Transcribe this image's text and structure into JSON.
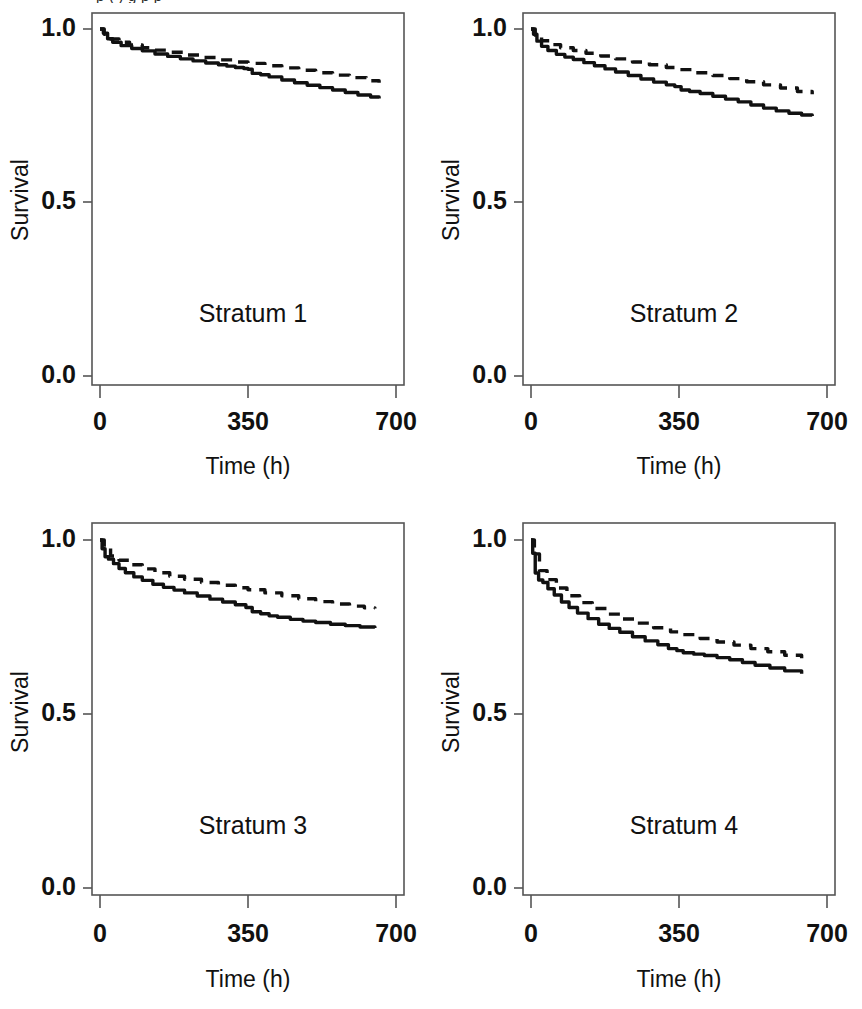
{
  "figure": {
    "clipped_top_text": "p             ( )  g      p                      p",
    "panel_count": 4,
    "grid": "2x2"
  },
  "axes": {
    "ylabel": "Survival",
    "xlabel": "Time (h)",
    "ytick_labels": [
      "1.0",
      "0.5",
      "0.0"
    ],
    "xtick_labels": [
      "0",
      "350",
      "700"
    ],
    "ylim": [
      0.0,
      1.0
    ],
    "xlim": [
      0,
      700
    ],
    "grid": false,
    "legend": "none"
  },
  "style": {
    "ink": "#111111",
    "frame": "#555555",
    "background": "#ffffff",
    "solid_series_name": "Observed",
    "dashed_series_name": "Predicted"
  },
  "chart_data": [
    {
      "type": "line",
      "title": "Stratum 1",
      "xlabel": "Time (h)",
      "ylabel": "Survival",
      "xlim": [
        0,
        700
      ],
      "ylim": [
        0.0,
        1.0
      ],
      "xticks": [
        0,
        350,
        700
      ],
      "yticks": [
        0.0,
        0.5,
        1.0
      ],
      "grid": false,
      "series": [
        {
          "name": "Observed",
          "style": "solid",
          "x": [
            0,
            8,
            18,
            30,
            50,
            75,
            100,
            130,
            160,
            190,
            220,
            250,
            280,
            300,
            320,
            340,
            350,
            360,
            380,
            400,
            430,
            460,
            490,
            520,
            550,
            580,
            610,
            640,
            660
          ],
          "y": [
            1.0,
            0.988,
            0.972,
            0.962,
            0.952,
            0.944,
            0.937,
            0.928,
            0.921,
            0.914,
            0.908,
            0.902,
            0.897,
            0.893,
            0.889,
            0.886,
            0.884,
            0.872,
            0.868,
            0.862,
            0.853,
            0.845,
            0.838,
            0.831,
            0.824,
            0.817,
            0.81,
            0.804,
            0.8
          ]
        },
        {
          "name": "Predicted",
          "style": "dashed",
          "x": [
            0,
            10,
            25,
            45,
            70,
            100,
            130,
            160,
            200,
            240,
            280,
            320,
            350,
            390,
            430,
            470,
            510,
            550,
            590,
            630,
            660
          ],
          "y": [
            1.0,
            0.985,
            0.971,
            0.962,
            0.954,
            0.946,
            0.939,
            0.933,
            0.925,
            0.918,
            0.911,
            0.905,
            0.901,
            0.894,
            0.888,
            0.881,
            0.874,
            0.867,
            0.86,
            0.851,
            0.845
          ]
        }
      ]
    },
    {
      "type": "line",
      "title": "Stratum 2",
      "xlabel": "Time (h)",
      "ylabel": "Survival",
      "xlim": [
        0,
        700
      ],
      "ylim": [
        0.0,
        1.0
      ],
      "xticks": [
        0,
        350,
        700
      ],
      "yticks": [
        0.0,
        0.5,
        1.0
      ],
      "grid": false,
      "series": [
        {
          "name": "Observed",
          "style": "solid",
          "x": [
            0,
            6,
            14,
            25,
            40,
            60,
            80,
            100,
            125,
            150,
            175,
            200,
            230,
            260,
            290,
            320,
            340,
            355,
            375,
            400,
            430,
            460,
            490,
            520,
            550,
            580,
            610,
            640,
            665
          ],
          "y": [
            1.0,
            0.985,
            0.965,
            0.95,
            0.938,
            0.927,
            0.919,
            0.912,
            0.903,
            0.894,
            0.885,
            0.876,
            0.866,
            0.856,
            0.847,
            0.839,
            0.834,
            0.824,
            0.82,
            0.814,
            0.806,
            0.798,
            0.79,
            0.781,
            0.772,
            0.764,
            0.757,
            0.752,
            0.749
          ]
        },
        {
          "name": "Predicted",
          "style": "dashed",
          "x": [
            0,
            10,
            25,
            45,
            70,
            100,
            130,
            165,
            200,
            240,
            280,
            320,
            350,
            390,
            430,
            470,
            510,
            550,
            590,
            630,
            665
          ],
          "y": [
            1.0,
            0.982,
            0.966,
            0.955,
            0.946,
            0.938,
            0.93,
            0.922,
            0.914,
            0.905,
            0.897,
            0.889,
            0.883,
            0.874,
            0.866,
            0.857,
            0.848,
            0.839,
            0.83,
            0.82,
            0.812
          ]
        }
      ]
    },
    {
      "type": "line",
      "title": "Stratum 3",
      "xlabel": "Time (h)",
      "ylabel": "Survival",
      "xlim": [
        0,
        700
      ],
      "ylim": [
        0.0,
        1.0
      ],
      "xticks": [
        0,
        350,
        700
      ],
      "yticks": [
        0.0,
        0.5,
        1.0
      ],
      "grid": false,
      "series": [
        {
          "name": "Observed",
          "style": "solid",
          "x": [
            0,
            5,
            12,
            20,
            32,
            45,
            60,
            80,
            100,
            125,
            150,
            175,
            200,
            230,
            260,
            290,
            320,
            345,
            360,
            380,
            400,
            420,
            450,
            480,
            510,
            545,
            580,
            615,
            650
          ],
          "y": [
            1.0,
            0.975,
            0.952,
            0.945,
            0.932,
            0.918,
            0.906,
            0.894,
            0.884,
            0.873,
            0.864,
            0.856,
            0.848,
            0.839,
            0.83,
            0.822,
            0.814,
            0.806,
            0.794,
            0.788,
            0.782,
            0.778,
            0.772,
            0.767,
            0.763,
            0.758,
            0.754,
            0.75,
            0.747
          ]
        },
        {
          "name": "Predicted",
          "style": "dashed",
          "x": [
            0,
            10,
            25,
            45,
            70,
            100,
            130,
            165,
            200,
            240,
            280,
            320,
            350,
            390,
            430,
            470,
            510,
            550,
            590,
            625,
            650
          ],
          "y": [
            1.0,
            0.976,
            0.954,
            0.942,
            0.929,
            0.917,
            0.906,
            0.896,
            0.887,
            0.878,
            0.87,
            0.863,
            0.857,
            0.848,
            0.84,
            0.831,
            0.823,
            0.816,
            0.81,
            0.805,
            0.803
          ]
        }
      ]
    },
    {
      "type": "line",
      "title": "Stratum 4",
      "xlabel": "Time (h)",
      "ylabel": "Survival",
      "xlim": [
        0,
        700
      ],
      "ylim": [
        0.0,
        1.0
      ],
      "xticks": [
        0,
        350,
        700
      ],
      "yticks": [
        0.0,
        0.5,
        1.0
      ],
      "grid": false,
      "series": [
        {
          "name": "Observed",
          "style": "solid",
          "x": [
            0,
            4,
            10,
            18,
            28,
            40,
            55,
            72,
            90,
            110,
            135,
            160,
            185,
            210,
            240,
            270,
            300,
            325,
            345,
            360,
            385,
            410,
            440,
            470,
            500,
            530,
            565,
            600,
            640
          ],
          "y": [
            1.0,
            0.962,
            0.905,
            0.885,
            0.878,
            0.86,
            0.842,
            0.822,
            0.806,
            0.79,
            0.774,
            0.758,
            0.746,
            0.735,
            0.722,
            0.71,
            0.699,
            0.688,
            0.682,
            0.676,
            0.672,
            0.668,
            0.662,
            0.656,
            0.648,
            0.64,
            0.632,
            0.624,
            0.616
          ]
        },
        {
          "name": "Predicted",
          "style": "dashed",
          "x": [
            0,
            8,
            20,
            38,
            60,
            85,
            115,
            145,
            180,
            215,
            250,
            290,
            330,
            360,
            400,
            440,
            480,
            520,
            560,
            600,
            640
          ],
          "y": [
            1.0,
            0.96,
            0.912,
            0.886,
            0.862,
            0.84,
            0.82,
            0.803,
            0.787,
            0.773,
            0.761,
            0.748,
            0.736,
            0.728,
            0.717,
            0.707,
            0.698,
            0.688,
            0.679,
            0.669,
            0.66
          ]
        }
      ]
    }
  ]
}
